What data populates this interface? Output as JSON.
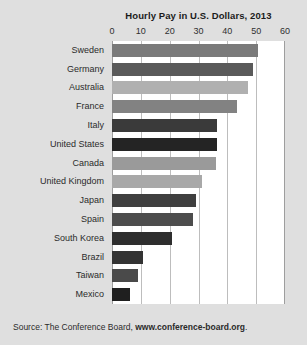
{
  "chart_data": {
    "type": "bar",
    "orientation": "horizontal",
    "title": "Hourly Pay in U.S. Dollars, 2013",
    "xlabel": "",
    "ylabel": "",
    "xlim": [
      0,
      60
    ],
    "xticks": [
      0,
      10,
      20,
      30,
      40,
      50,
      60
    ],
    "xtick_labels": [
      "0",
      "10",
      "20",
      "30",
      "40",
      "50",
      "60"
    ],
    "grid": true,
    "grid_axis": "x",
    "legend": false,
    "categories": [
      "Sweden",
      "Germany",
      "Australia",
      "France",
      "Italy",
      "United States",
      "Canada",
      "United Kingdom",
      "Japan",
      "Spain",
      "South Korea",
      "Brazil",
      "Taiwan",
      "Mexico"
    ],
    "values": [
      50.5,
      48.9,
      47.2,
      43.3,
      36.5,
      36.3,
      36.2,
      31.1,
      29.0,
      28.0,
      20.7,
      10.6,
      9.1,
      6.4
    ],
    "bar_colors": [
      "#7a7a7a",
      "#5a5a5a",
      "#b0b0b0",
      "#828282",
      "#3a3a3a",
      "#242424",
      "#9a9a9a",
      "#a8a8a8",
      "#3f3f3f",
      "#4d4d4d",
      "#2e2e2e",
      "#333333",
      "#4a4a4a",
      "#1f1f1f"
    ],
    "plot_background": "#ffffff",
    "figure_background": "#dfdfdf",
    "gridline_color": "#bdbdbd"
  },
  "source": {
    "prefix": "Source: The Conference Board, ",
    "url": "www.conference-board.org",
    "suffix": "."
  }
}
